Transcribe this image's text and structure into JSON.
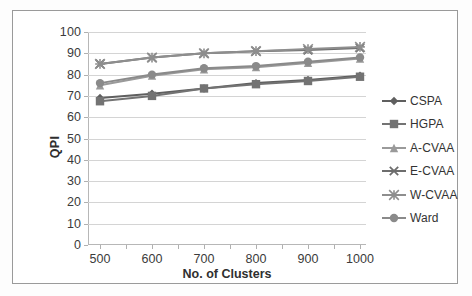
{
  "chart_data": {
    "type": "line",
    "title": "",
    "xlabel": "No. of Clusters",
    "ylabel": "QPI",
    "x": [
      500,
      600,
      700,
      800,
      900,
      1000
    ],
    "categories": [
      "500",
      "600",
      "700",
      "800",
      "900",
      "1000"
    ],
    "xlim": [
      500,
      1000
    ],
    "ylim": [
      0,
      100
    ],
    "ytick_labels": [
      "0",
      "10",
      "20",
      "30",
      "40",
      "50",
      "60",
      "70",
      "80",
      "90",
      "100"
    ],
    "ytick_values": [
      0,
      10,
      20,
      30,
      40,
      50,
      60,
      70,
      80,
      90,
      100
    ],
    "grid": "horizontal",
    "legend_position": "right",
    "series": [
      {
        "name": "CSPA",
        "marker": "diamond",
        "color": "#5f5f5f",
        "values": [
          69,
          71,
          73.5,
          76,
          77.5,
          79.5
        ]
      },
      {
        "name": "HGPA",
        "marker": "square",
        "color": "#737373",
        "values": [
          67.5,
          70,
          73.5,
          75.5,
          77,
          79
        ]
      },
      {
        "name": "A-CVAA",
        "marker": "triangle",
        "color": "#9a9a9a",
        "values": [
          75,
          79.5,
          82.5,
          83.5,
          85.5,
          87.5
        ]
      },
      {
        "name": "E-CVAA",
        "marker": "cross",
        "color": "#6d6d6d",
        "values": [
          85,
          88,
          90,
          91,
          91.5,
          92.5
        ]
      },
      {
        "name": "W-CVAA",
        "marker": "star",
        "color": "#8e8e8e",
        "values": [
          85,
          88,
          90,
          91,
          92,
          93
        ]
      },
      {
        "name": "Ward",
        "marker": "circle",
        "color": "#8a8a8a",
        "values": [
          76,
          80,
          83,
          84,
          86,
          88
        ]
      }
    ]
  },
  "legend": {
    "items": [
      {
        "label": "CSPA"
      },
      {
        "label": "HGPA"
      },
      {
        "label": "A-CVAA"
      },
      {
        "label": "E-CVAA"
      },
      {
        "label": "W-CVAA"
      },
      {
        "label": "Ward"
      }
    ]
  },
  "axes": {
    "y_title": "QPI",
    "x_title": "No. of Clusters"
  },
  "colors": {
    "frame": "#9a9a9a",
    "gridline": "#d4d4d4",
    "axis": "#b7b7b7",
    "text": "#3b3b3b",
    "background": "#ffffff"
  }
}
